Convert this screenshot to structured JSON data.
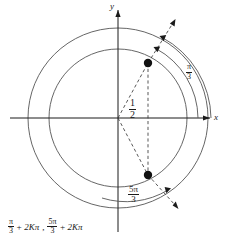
{
  "figure": {
    "type": "unit-circle-trigonometry-diagram",
    "axes": {
      "x_label": "x",
      "y_label": "y",
      "origin": [
        118,
        118
      ]
    },
    "circles": [
      {
        "name": "inner-circle",
        "cx": 118,
        "cy": 118,
        "r": 69
      },
      {
        "name": "outer-circle",
        "cx": 118,
        "cy": 118,
        "r": 90
      }
    ],
    "points": [
      {
        "name": "point-pi-over-3",
        "x": 148,
        "y": 63,
        "angle_label": "π/3"
      },
      {
        "name": "point-5pi-over-3",
        "x": 148,
        "y": 175,
        "angle_label": "5π/3"
      }
    ],
    "labels": {
      "half": {
        "numerator": "1",
        "denominator": "2"
      },
      "pi_over_3": {
        "numerator": "π",
        "denominator": "3"
      },
      "five_pi_over_3": {
        "numerator": "5π",
        "denominator": "3"
      }
    },
    "formula": {
      "term1": {
        "numerator": "π",
        "denominator": "3"
      },
      "plus1": "+",
      "periodic1": "2Kπ",
      "separator": ",",
      "term2": {
        "numerator": "5π",
        "denominator": "3"
      },
      "plus2": "+",
      "periodic2": "2Kπ"
    },
    "colors": {
      "stroke": "#4a4a4a",
      "axis": "#1a1a1a",
      "text": "#1a1a1a",
      "background": "#ffffff",
      "point_fill": "#111111"
    }
  }
}
